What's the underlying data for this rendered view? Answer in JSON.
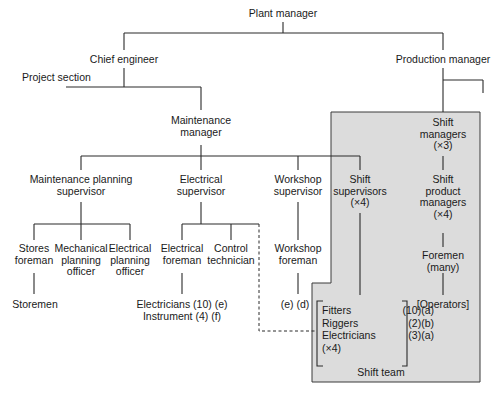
{
  "colors": {
    "line": "#2a2a2a",
    "shift_team_fill": "#dcdcdc",
    "shift_team_border": "#3a3a3a"
  },
  "nodes": {
    "plant_manager": "Plant manager",
    "chief_engineer": "Chief engineer",
    "project_section": "Project section",
    "production_manager": "Production manager",
    "maintenance_manager": [
      "Maintenance",
      "manager"
    ],
    "maintenance_planning_supervisor": [
      "Maintenance planning",
      "supervisor"
    ],
    "electrical_supervisor": [
      "Electrical",
      "supervisor"
    ],
    "workshop_supervisor": [
      "Workshop",
      "supervisor"
    ],
    "shift_supervisors": [
      "Shift",
      "supervisors",
      "(×4)"
    ],
    "shift_managers": [
      "Shift",
      "managers",
      "(×3)"
    ],
    "shift_product_managers": [
      "Shift",
      "product",
      "managers",
      "(×4)"
    ],
    "foremen": [
      "Foremen",
      "(many)"
    ],
    "operators": "[Operators]",
    "stores_foreman": [
      "Stores",
      "foreman"
    ],
    "mechanical_planning_officer": [
      "Mechanical",
      "planning",
      "officer"
    ],
    "electrical_planning_officer": [
      "Electrical",
      "planning",
      "officer"
    ],
    "storemen": "Storemen",
    "electrical_foreman": [
      "Electrical",
      "foreman"
    ],
    "control_technician": [
      "Control",
      "technician"
    ],
    "electricians_instrument": [
      "Electricians (10) (e)",
      "Instrument (4) (f)"
    ],
    "workshop_foreman": [
      "Workshop",
      "foreman"
    ],
    "workshop_staff": "(e) (d)"
  },
  "shift_team": {
    "label": "Shift team",
    "crew": [
      {
        "role": "Fitters",
        "count": "(10)(a)"
      },
      {
        "role": "Riggers",
        "count": "(2)(b)"
      },
      {
        "role": "Electricians",
        "count": "(3)(a)"
      }
    ],
    "multiplier": "(×4)"
  }
}
